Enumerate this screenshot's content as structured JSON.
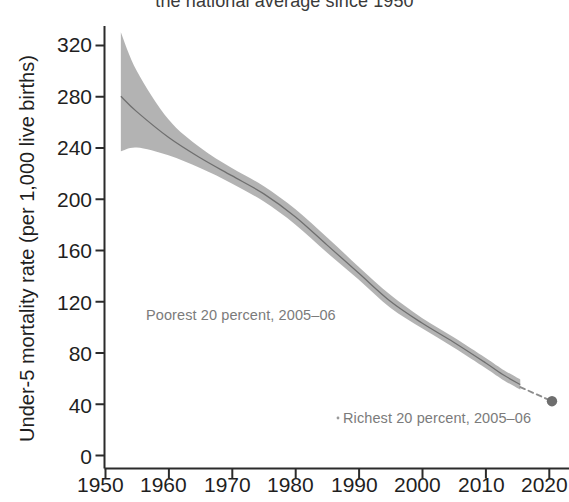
{
  "chart_data": {
    "type": "line",
    "title": "the national average since 1950",
    "xlabel": "",
    "ylabel": "Under-5 mortality rate (per 1,000 live births)",
    "xlim": [
      1950,
      2021
    ],
    "ylim": [
      0,
      335
    ],
    "xticks": [
      "1950",
      "1960",
      "1970",
      "1980",
      "1990",
      "2000",
      "2010",
      "2020"
    ],
    "xtick_values": [
      1950,
      1960,
      1970,
      1980,
      1990,
      2000,
      2010,
      2020
    ],
    "yticks": [
      "0",
      "40",
      "80",
      "120",
      "160",
      "200",
      "240",
      "280",
      "320"
    ],
    "ytick_values": [
      0,
      40,
      80,
      120,
      160,
      200,
      240,
      280,
      320
    ],
    "grid": false,
    "legend_position": "none",
    "band_color": "#aaaaaa",
    "line_color": "#8a8a8a",
    "marker_color": "#7a7a7a",
    "axis_color": "#2b2b2b",
    "series": [
      {
        "name": "National average under-5 mortality rate (central estimate)",
        "x": [
          1952.5,
          1955,
          1960,
          1965,
          1970,
          1975,
          1980,
          1985,
          1990,
          1995,
          2000,
          2005,
          2010,
          2013,
          2015.5
        ],
        "values": [
          280,
          268,
          248,
          232,
          218,
          204,
          186,
          164,
          142,
          120,
          103,
          88,
          72,
          62,
          55
        ]
      },
      {
        "name": "Upper uncertainty bound",
        "x": [
          1952.5,
          1955,
          1960,
          1965,
          1970,
          1975,
          1980,
          1985,
          1990,
          1995,
          2000,
          2005,
          2010,
          2013,
          2015.5
        ],
        "values": [
          330,
          300,
          262,
          240,
          224,
          210,
          192,
          170,
          147,
          125,
          107,
          92,
          76,
          66,
          59
        ]
      },
      {
        "name": "Lower uncertainty bound",
        "x": [
          1952.5,
          1955,
          1960,
          1965,
          1970,
          1975,
          1980,
          1985,
          1990,
          1995,
          2000,
          2005,
          2010,
          2013,
          2015.5
        ],
        "values": [
          237,
          240,
          234,
          224,
          212,
          198,
          180,
          158,
          137,
          115,
          99,
          84,
          68,
          58,
          51
        ]
      }
    ],
    "projection": {
      "name": "Projected trend to 2020",
      "style": "dashed",
      "x": [
        2015.5,
        2020.5
      ],
      "values": [
        53,
        42
      ]
    },
    "markers": [
      {
        "name": "endpoint-2020",
        "x": 2020.5,
        "value": 42
      }
    ],
    "annotations": [
      {
        "name": "poorest-quintile",
        "text": "Poorest 20 percent, 2005–06"
      },
      {
        "name": "richest-quintile",
        "text": "Richest 20 percent, 2005–06"
      }
    ]
  }
}
